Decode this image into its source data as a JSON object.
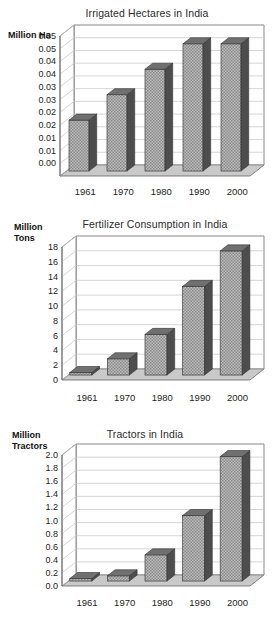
{
  "figure": {
    "kind": "three-panel-bar-chart-figure",
    "panel_count": 3
  },
  "chart_data": [
    {
      "type": "bar",
      "title": "Irrigated Hectares in India",
      "xlabel": "",
      "ylabel": "Million Ha",
      "categories": [
        "1961",
        "1970",
        "1980",
        "1990",
        "2000"
      ],
      "values": [
        0.02,
        0.03,
        0.04,
        0.05,
        0.05
      ],
      "ylim": [
        0.0,
        0.055
      ],
      "ytick_values": [
        0.055,
        0.05,
        0.045,
        0.04,
        0.035,
        0.03,
        0.025,
        0.02,
        0.015,
        0.01,
        0.005,
        0.0
      ],
      "ytick_labels": [
        "0.05",
        "0.05",
        "0.04",
        "0.04",
        "0.03",
        "0.03",
        "0.02",
        "0.02",
        "0.01",
        "0.01",
        "0.00"
      ],
      "grid": true,
      "legend": "none",
      "style": "3d-column"
    },
    {
      "type": "bar",
      "title": "Fertilizer Consumption in India",
      "xlabel": "",
      "ylabel": "Million Tons",
      "categories": [
        "1961",
        "1970",
        "1980",
        "1990",
        "2000"
      ],
      "values": [
        0.3,
        2.2,
        5.5,
        12.0,
        16.8
      ],
      "ylim": [
        0,
        18
      ],
      "ytick_values": [
        18,
        16,
        14,
        12,
        10,
        8,
        6,
        4,
        2,
        0
      ],
      "ytick_labels": [
        "18",
        "16",
        "14",
        "12",
        "10",
        "8",
        "6",
        "4",
        "2",
        "0"
      ],
      "grid": true,
      "legend": "none",
      "style": "3d-column"
    },
    {
      "type": "bar",
      "title": "Tractors in India",
      "xlabel": "",
      "ylabel": "Million Tractors",
      "categories": [
        "1961",
        "1970",
        "1980",
        "1990",
        "2000"
      ],
      "values": [
        0.03,
        0.08,
        0.4,
        1.0,
        1.9
      ],
      "ylim": [
        0.0,
        2.0
      ],
      "ytick_values": [
        2.0,
        1.8,
        1.6,
        1.4,
        1.2,
        1.0,
        0.8,
        0.6,
        0.4,
        0.2,
        0.0
      ],
      "ytick_labels": [
        "2.0",
        "1.8",
        "1.6",
        "1.4",
        "1.2",
        "1.0",
        "0.8",
        "0.6",
        "0.4",
        "0.2",
        "0.0"
      ],
      "grid": true,
      "legend": "none",
      "style": "3d-column"
    }
  ],
  "colors": {
    "bar_face": "#a8a8a8",
    "bar_side": "#4d4d4d",
    "bar_top": "#707070",
    "floor": "#c9c9c9",
    "gridline": "#c4c4c4",
    "axis": "#555555",
    "plot_background": "#ffffff",
    "text": "#1a1a1a"
  },
  "titles": {
    "chart0": "Irrigated Hectares in India",
    "chart1": "Fertilizer Consumption in India",
    "chart2": "Tractors in India"
  },
  "axis_labels": {
    "chart0_line1": "Million Ha",
    "chart0_line2": "",
    "chart1_line1": "Million",
    "chart1_line2": "Tons",
    "chart2_line1": "Million",
    "chart2_line2": "Tractors"
  }
}
